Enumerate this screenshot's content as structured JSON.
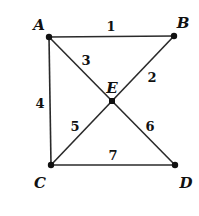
{
  "diagram": {
    "type": "graph",
    "vertices": [
      {
        "id": "A",
        "label": "A",
        "x": 49,
        "y": 37,
        "lx": 39,
        "ly": 30
      },
      {
        "id": "B",
        "label": "B",
        "x": 174,
        "y": 36,
        "lx": 183,
        "ly": 28
      },
      {
        "id": "C",
        "label": "C",
        "x": 51,
        "y": 165,
        "lx": 40,
        "ly": 188
      },
      {
        "id": "D",
        "label": "D",
        "x": 175,
        "y": 165,
        "lx": 186,
        "ly": 188
      },
      {
        "id": "E",
        "label": "E",
        "x": 112,
        "y": 101,
        "lx": 112,
        "ly": 93
      }
    ],
    "edges": [
      {
        "id": "1",
        "label": "1",
        "from": "A",
        "to": "B",
        "lx": 111,
        "ly": 31
      },
      {
        "id": "2",
        "label": "2",
        "from": "E",
        "to": "B",
        "lx": 152,
        "ly": 82
      },
      {
        "id": "3",
        "label": "3",
        "from": "A",
        "to": "E",
        "lx": 86,
        "ly": 65
      },
      {
        "id": "4",
        "label": "4",
        "from": "A",
        "to": "C",
        "lx": 40,
        "ly": 108
      },
      {
        "id": "5",
        "label": "5",
        "from": "C",
        "to": "E",
        "lx": 75,
        "ly": 131
      },
      {
        "id": "6",
        "label": "6",
        "from": "E",
        "to": "D",
        "lx": 150,
        "ly": 131
      },
      {
        "id": "7",
        "label": "7",
        "from": "C",
        "to": "D",
        "lx": 113,
        "ly": 160
      }
    ]
  }
}
